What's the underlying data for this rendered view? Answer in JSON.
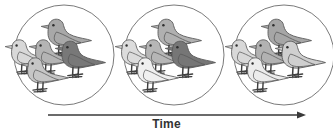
{
  "figure": {
    "title": "",
    "axis_label": "Time",
    "background_color": "#ffffff",
    "outline_color": "#595959",
    "arrow_color": "#3a3a3a",
    "leg_color": "#3f3f3f",
    "panel_count": 3,
    "birds_per_panel": 5,
    "circle": {
      "radius": 50,
      "centers_x": [
        64,
        174,
        284
      ],
      "center_y": 55,
      "stroke": "#7a7a7a",
      "stroke_width": 1
    },
    "arrow": {
      "x_start": 48,
      "x_end": 306,
      "y": 115,
      "head_length": 9,
      "head_width": 7
    },
    "shades": {
      "near_white": "#f2f2f2",
      "very_light": "#e2e2e2",
      "light": "#d2d2d2",
      "light_mid": "#c0c0c0",
      "mid": "#a8a8a8",
      "mid_dark": "#949494",
      "dark": "#787878",
      "darkest": "#5e5e5e"
    },
    "panels": [
      {
        "name": "panel-1",
        "label": "generation-1",
        "birds": [
          {
            "id": "bird-1-back",
            "shade": "#a8a8a8",
            "x": 40,
            "y": 13,
            "scale": 1.0,
            "z": 1
          },
          {
            "id": "bird-1-left",
            "shade": "#d8d8d8",
            "x": 4,
            "y": 34,
            "scale": 0.94,
            "z": 2
          },
          {
            "id": "bird-1-center",
            "shade": "#b4b4b4",
            "x": 28,
            "y": 34,
            "scale": 0.94,
            "z": 3
          },
          {
            "id": "bird-1-right-dark",
            "shade": "#787878",
            "x": 54,
            "y": 35,
            "scale": 1.0,
            "z": 4
          },
          {
            "id": "bird-1-front",
            "shade": "#c6c6c6",
            "x": 20,
            "y": 52,
            "scale": 0.94,
            "z": 5
          }
        ]
      },
      {
        "name": "panel-2",
        "label": "generation-2",
        "birds": [
          {
            "id": "bird-2-back",
            "shade": "#b0b0b0",
            "x": 150,
            "y": 13,
            "scale": 1.0,
            "z": 1
          },
          {
            "id": "bird-2-left",
            "shade": "#dcdcdc",
            "x": 114,
            "y": 34,
            "scale": 0.94,
            "z": 2
          },
          {
            "id": "bird-2-center",
            "shade": "#b6b6b6",
            "x": 138,
            "y": 34,
            "scale": 0.94,
            "z": 3
          },
          {
            "id": "bird-2-right-dark",
            "shade": "#767676",
            "x": 164,
            "y": 35,
            "scale": 1.0,
            "z": 4
          },
          {
            "id": "bird-2-front-pale",
            "shade": "#f0f0f0",
            "x": 130,
            "y": 52,
            "scale": 0.94,
            "z": 5
          }
        ]
      },
      {
        "name": "panel-3",
        "label": "generation-3",
        "birds": [
          {
            "id": "bird-3-back",
            "shade": "#a6a6a6",
            "x": 260,
            "y": 13,
            "scale": 1.0,
            "z": 1
          },
          {
            "id": "bird-3-left",
            "shade": "#d8d8d8",
            "x": 224,
            "y": 34,
            "scale": 0.94,
            "z": 2
          },
          {
            "id": "bird-3-center",
            "shade": "#b2b2b2",
            "x": 248,
            "y": 34,
            "scale": 0.94,
            "z": 3
          },
          {
            "id": "bird-3-right-light",
            "shade": "#cfcfcf",
            "x": 274,
            "y": 35,
            "scale": 1.0,
            "z": 4
          },
          {
            "id": "bird-3-front-pale",
            "shade": "#ececec",
            "x": 240,
            "y": 52,
            "scale": 0.94,
            "z": 5
          }
        ]
      }
    ]
  }
}
